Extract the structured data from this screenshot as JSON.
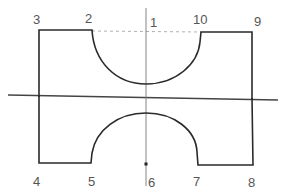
{
  "diagram": {
    "point_labels": {
      "p1": "1",
      "p2": "2",
      "p3": "3",
      "p4": "4",
      "p5": "5",
      "p6": "6",
      "p7": "7",
      "p8": "8",
      "p9": "9",
      "p10": "10"
    },
    "colors": {
      "outline": "#2a2a2a",
      "axis": "#444444",
      "dashed": "#9a9a9a",
      "label": "#555555"
    }
  }
}
